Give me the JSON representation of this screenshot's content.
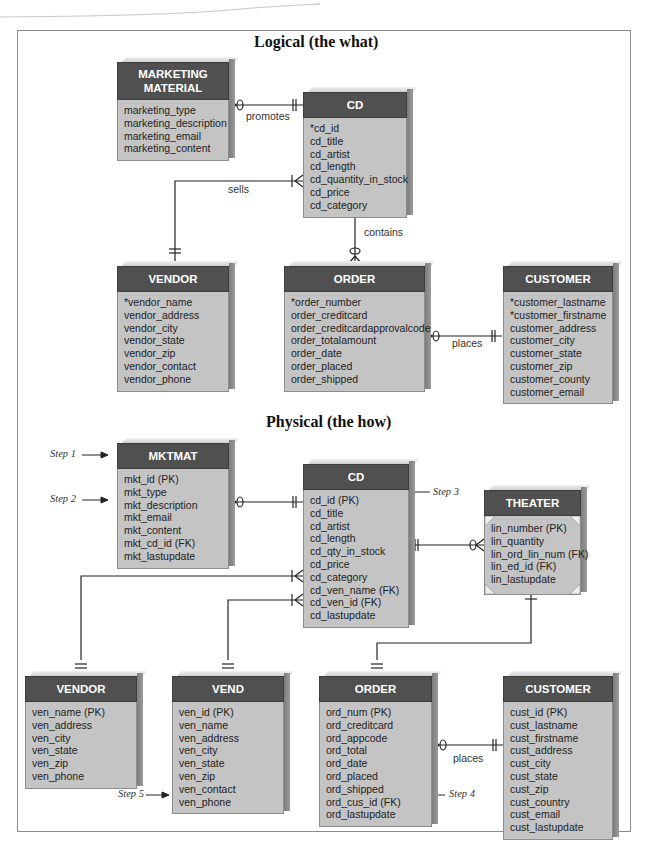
{
  "logical": {
    "title": "Logical (the what)",
    "entities": {
      "marketing_material": {
        "name": "MARKETING MATERIAL",
        "attributes": [
          "marketing_type",
          "marketing_description",
          "marketing_email",
          "marketing_content"
        ]
      },
      "cd": {
        "name": "CD",
        "attributes": [
          "*cd_id",
          "cd_title",
          "cd_artist",
          "cd_length",
          "cd_quantity_in_stock",
          "cd_price",
          "cd_category"
        ]
      },
      "vendor": {
        "name": "VENDOR",
        "attributes": [
          "*vendor_name",
          "vendor_address",
          "vendor_city",
          "vendor_state",
          "vendor_zip",
          "vendor_contact",
          "vendor_phone"
        ]
      },
      "order": {
        "name": "ORDER",
        "attributes": [
          "*order_number",
          "order_creditcard",
          "order_creditcardapprovalcode",
          "order_totalamount",
          "order_date",
          "order_placed",
          "order_shipped"
        ]
      },
      "customer": {
        "name": "CUSTOMER",
        "attributes": [
          "*customer_lastname",
          "*customer_firstname",
          "customer_address",
          "customer_city",
          "customer_state",
          "customer_zip",
          "customer_county",
          "customer_email"
        ]
      }
    },
    "relationships": {
      "promotes": "promotes",
      "sells": "sells",
      "contains": "contains",
      "places": "places"
    }
  },
  "physical": {
    "title": "Physical (the how)",
    "entities": {
      "mktmat": {
        "name": "MKTMAT",
        "attributes": [
          "mkt_id (PK)",
          "mkt_type",
          "mkt_description",
          "mkt_email",
          "mkt_content",
          "mkt_cd_id (FK)",
          "mkt_lastupdate"
        ]
      },
      "cd": {
        "name": "CD",
        "attributes": [
          "cd_id (PK)",
          "cd_title",
          "cd_artist",
          "cd_length",
          "cd_qty_in_stock",
          "cd_price",
          "cd_category",
          "cd_ven_name (FK)",
          "cd_ven_id (FK)",
          "cd_lastupdate"
        ]
      },
      "theater": {
        "name": "THEATER",
        "attributes": [
          "lin_number (PK)",
          "lin_quantity",
          "lin_ord_lin_num (FK)",
          "lin_ed_id (FK)",
          "lin_lastupdate"
        ]
      },
      "vendor": {
        "name": "VENDOR",
        "attributes": [
          "ven_name (PK)",
          "ven_address",
          "ven_city",
          "ven_state",
          "ven_zip",
          "ven_phone"
        ]
      },
      "vend": {
        "name": "VEND",
        "attributes": [
          "ven_id (PK)",
          "ven_name",
          "ven_address",
          "ven_city",
          "ven_state",
          "ven_zip",
          "ven_contact",
          "ven_phone"
        ]
      },
      "order": {
        "name": "ORDER",
        "attributes": [
          "ord_num (PK)",
          "ord_creditcard",
          "ord_appcode",
          "ord_total",
          "ord_date",
          "ord_placed",
          "ord_shipped",
          "ord_cus_id (FK)",
          "ord_lastupdate"
        ]
      },
      "customer": {
        "name": "CUSTOMER",
        "attributes": [
          "cust_id (PK)",
          "cust_lastname",
          "cust_firstname",
          "cust_address",
          "cust_city",
          "cust_state",
          "cust_zip",
          "cust_country",
          "cust_email",
          "cust_lastupdate"
        ]
      }
    },
    "relationships": {
      "places": "places"
    },
    "steps": {
      "step1": "Step 1",
      "step2": "Step 2",
      "step3": "Step 3",
      "step4": "Step 4",
      "step5": "Step 5"
    }
  }
}
